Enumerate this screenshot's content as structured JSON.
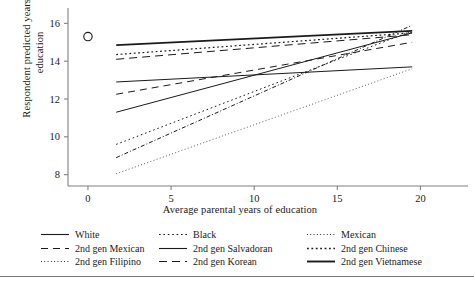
{
  "chart_data": {
    "type": "line",
    "title": "",
    "xlabel": "Average parental years of education",
    "ylabel": "Respondent predicted years of education",
    "xlim": [
      -1.2,
      22.5
    ],
    "ylim": [
      7.4,
      16.6
    ],
    "xticks": [
      0,
      5,
      10,
      15,
      20
    ],
    "yticks": [
      8,
      10,
      12,
      14,
      16
    ],
    "grid": false,
    "legend_position": "below-axis",
    "legend_columns": 3,
    "marker_note": "open circle on y-axis at x=0",
    "markers": [
      {
        "name": "observed-mean-marker",
        "x": 0,
        "y": 15.3,
        "shape": "open-circle"
      }
    ],
    "x_range_of_fits": [
      1.7,
      19.5
    ],
    "series": [
      {
        "name": "White",
        "style": "solid",
        "width": 1.0,
        "x": [
          1.7,
          19.5
        ],
        "values": [
          11.3,
          15.5
        ]
      },
      {
        "name": "Black",
        "style": "dotted",
        "width": 1.0,
        "x": [
          1.7,
          19.5
        ],
        "values": [
          9.6,
          15.6
        ]
      },
      {
        "name": "Mexican",
        "style": "fine-dotted",
        "width": 0.8,
        "x": [
          1.7,
          19.5
        ],
        "values": [
          8.05,
          13.6
        ]
      },
      {
        "name": "2nd gen Mexican",
        "style": "dashed",
        "width": 1.0,
        "x": [
          1.7,
          19.5
        ],
        "values": [
          12.25,
          15.0
        ]
      },
      {
        "name": "2nd gen Salvadoran",
        "style": "solid",
        "width": 1.6,
        "x": [
          1.7,
          19.5
        ],
        "values": [
          14.85,
          15.6
        ]
      },
      {
        "name": "2nd gen Chinese",
        "style": "square-dot",
        "width": 1.2,
        "x": [
          1.7,
          19.5
        ],
        "values": [
          14.35,
          15.5
        ]
      },
      {
        "name": "2nd gen Filipino",
        "style": "dash-dot",
        "width": 1.0,
        "x": [
          1.7,
          19.5
        ],
        "values": [
          8.9,
          15.9
        ]
      },
      {
        "name": "2nd gen Korean",
        "style": "long-dash",
        "width": 1.0,
        "x": [
          1.7,
          19.5
        ],
        "values": [
          14.1,
          15.4
        ]
      },
      {
        "name": "2nd gen Vietnamese",
        "style": "solid",
        "width": 1.0,
        "x": [
          1.7,
          19.5
        ],
        "values": [
          12.9,
          13.7
        ]
      }
    ]
  },
  "legend": {
    "rows": [
      [
        {
          "label": "White",
          "style": "solid"
        },
        {
          "label": "Black",
          "style": "dotted"
        },
        {
          "label": "Mexican",
          "style": "fine-dotted"
        }
      ],
      [
        {
          "label": "2nd gen Mexican",
          "style": "dashed"
        },
        {
          "label": "2nd gen Salvadoran",
          "style": "solid"
        },
        {
          "label": "2nd gen Chinese",
          "style": "square-dot"
        }
      ],
      [
        {
          "label": "2nd gen Filipino",
          "style": "fine-dotted"
        },
        {
          "label": "2nd gen Korean",
          "style": "long-dash"
        },
        {
          "label": "2nd gen Vietnamese",
          "style": "solid-bold"
        }
      ]
    ]
  },
  "colors": {
    "line": "#1a1a1a",
    "axis": "#808080",
    "background": "#ffffff"
  }
}
